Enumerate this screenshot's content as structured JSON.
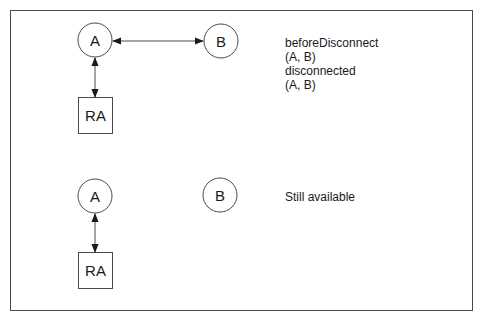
{
  "diagram": {
    "top": {
      "nodes": {
        "a": {
          "label": "A",
          "shape": "circle"
        },
        "b": {
          "label": "B",
          "shape": "circle"
        },
        "ra": {
          "label": "RA",
          "shape": "box"
        }
      },
      "edges": [
        {
          "from": "A",
          "to": "B",
          "style": "bidirectional-arrow"
        },
        {
          "from": "A",
          "to": "RA",
          "style": "bidirectional-arrow"
        }
      ],
      "note_lines": [
        "beforeDisconnect",
        "(A, B)",
        "disconnected",
        "(A, B)"
      ]
    },
    "bottom": {
      "nodes": {
        "a": {
          "label": "A",
          "shape": "circle"
        },
        "b": {
          "label": "B",
          "shape": "circle"
        },
        "ra": {
          "label": "RA",
          "shape": "box"
        }
      },
      "edges": [
        {
          "from": "A",
          "to": "RA",
          "style": "bidirectional-arrow"
        }
      ],
      "note_lines": [
        "Still available"
      ]
    }
  },
  "colors": {
    "stroke": "#4a4a4a",
    "text": "#1a1a1a",
    "background": "#ffffff"
  }
}
